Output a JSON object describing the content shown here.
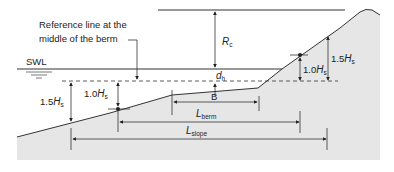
{
  "diagram": {
    "callout": {
      "line1": "Reference line at the",
      "line2": "middle of the berm"
    },
    "swl_label": "SWL",
    "dimensions": {
      "rc": {
        "symbol": "R",
        "sub": "c"
      },
      "dh": {
        "symbol": "d",
        "sub": "h"
      },
      "b": {
        "symbol": "B"
      },
      "upper_1_5": {
        "prefix": "1.5",
        "symbol": "H",
        "sub": "s"
      },
      "upper_1_0": {
        "prefix": "1.0",
        "symbol": "H",
        "sub": "s"
      },
      "lower_1_5": {
        "prefix": "1.5",
        "symbol": "H",
        "sub": "s"
      },
      "lower_1_0": {
        "prefix": "1.0",
        "symbol": "H",
        "sub": "s"
      },
      "lberm": {
        "symbol": "L",
        "sub": "berm"
      },
      "lslope": {
        "symbol": "L",
        "sub": "slope"
      }
    },
    "colors": {
      "structure_fill": "#e6e6e6",
      "line": "#333333"
    }
  }
}
